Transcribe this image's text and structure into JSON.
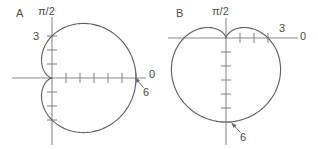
{
  "figure": {
    "background_color": "#ffffff",
    "curve_color": "#606060",
    "axis_color": "#8a8a8a",
    "text_color": "#4a4a4a",
    "width": 318,
    "height": 149
  },
  "panels": [
    {
      "id": "A",
      "label": "A",
      "polar_axis_label": "π/2",
      "zero_axis_label": "0",
      "intercept_label": "3",
      "max_label": "6",
      "origin": {
        "x": 52,
        "y": 78
      },
      "unit_px": 14.0,
      "curve_equation": "r = 3(1 + cos(theta))",
      "a": 3,
      "orientation": "right",
      "max_radius": 6,
      "perpendicular_intercept": 3,
      "horizontal_ticks": [
        1,
        2,
        3,
        4,
        5,
        6
      ],
      "vertical_ticks": [
        1,
        2,
        3
      ]
    },
    {
      "id": "B",
      "label": "B",
      "polar_axis_label": "π/2",
      "zero_axis_label": "0",
      "intercept_label": "3",
      "max_label": "6",
      "origin": {
        "x": 226,
        "y": 38
      },
      "unit_px": 14.0,
      "curve_equation": "r = 3(1 - sin(theta))",
      "a": 3,
      "orientation": "down",
      "max_radius": 6,
      "perpendicular_intercept": 3,
      "horizontal_ticks": [
        1,
        2,
        3
      ],
      "vertical_ticks": [
        1,
        2,
        3,
        4,
        5,
        6
      ]
    }
  ],
  "chart_data": {
    "type": "line",
    "title": "",
    "xlabel": "",
    "ylabel": "",
    "plots": [
      {
        "name": "A",
        "kind": "polar-cardioid",
        "equation": "r = 3(1 + cos θ)",
        "annotations": [
          "π/2",
          "0",
          "3",
          "6"
        ],
        "key_points": [
          {
            "theta_deg": 0,
            "r": 6
          },
          {
            "theta_deg": 90,
            "r": 3
          },
          {
            "theta_deg": 180,
            "r": 0
          },
          {
            "theta_deg": 270,
            "r": 3
          }
        ]
      },
      {
        "name": "B",
        "kind": "polar-cardioid",
        "equation": "r = 3(1 - sin θ)",
        "annotations": [
          "π/2",
          "0",
          "3",
          "6"
        ],
        "key_points": [
          {
            "theta_deg": 0,
            "r": 3
          },
          {
            "theta_deg": 90,
            "r": 0
          },
          {
            "theta_deg": 180,
            "r": 3
          },
          {
            "theta_deg": 270,
            "r": 6
          }
        ]
      }
    ]
  }
}
